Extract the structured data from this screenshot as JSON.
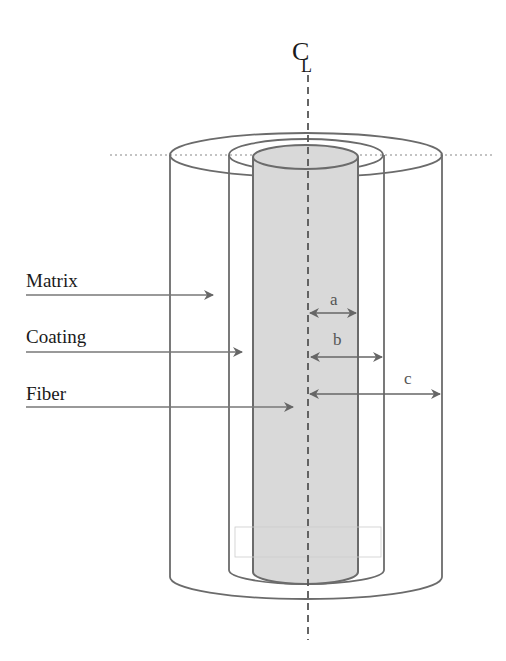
{
  "diagram": {
    "type": "cross-section schematic",
    "centerline_symbol": "CL",
    "labels": {
      "matrix": "Matrix",
      "coating": "Coating",
      "fiber": "Fiber"
    },
    "dimensions": {
      "a": "a",
      "b": "b",
      "c": "c"
    },
    "dimension_meaning": {
      "a": "fiber radius",
      "b": "coating outer radius",
      "c": "matrix outer radius"
    },
    "colors": {
      "line": "#6b6b6b",
      "fiber_fill": "#d9d9d9",
      "text": "#1a1a1a",
      "background": "#ffffff"
    }
  }
}
